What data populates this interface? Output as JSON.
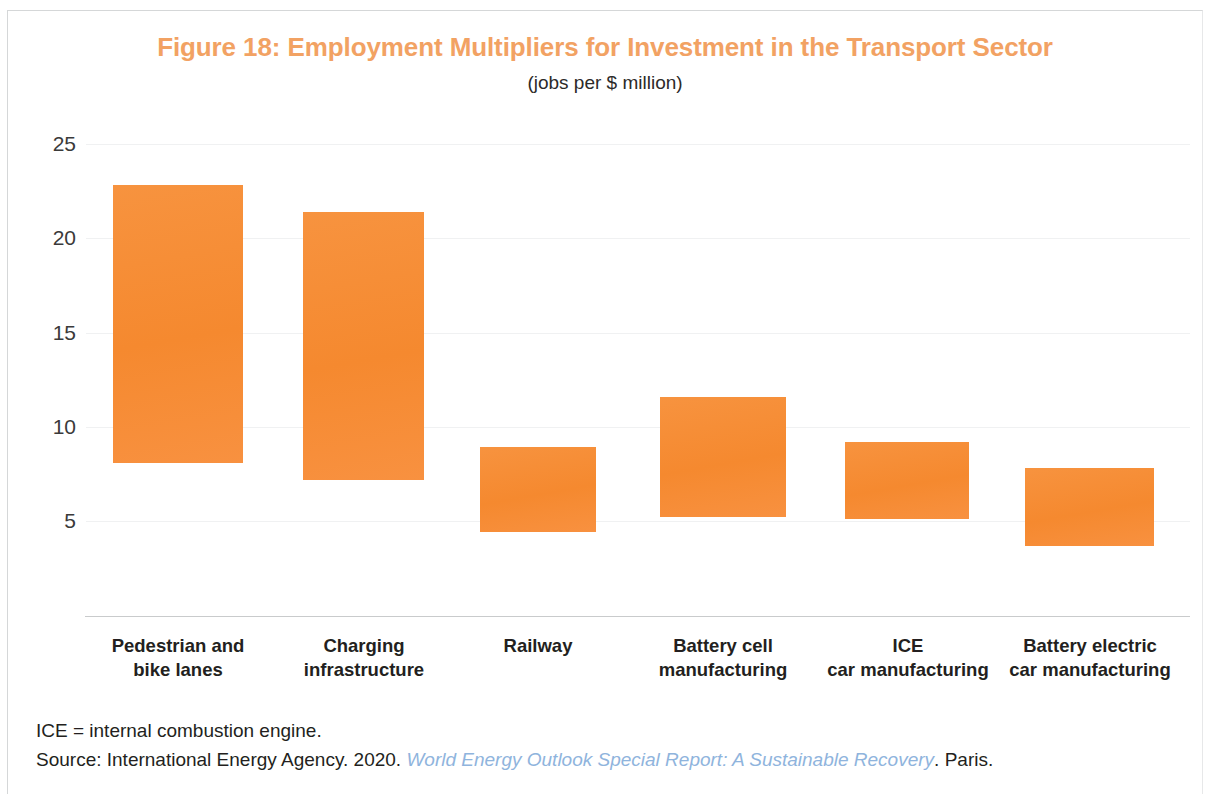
{
  "figure": {
    "title": "Figure 18: Employment Multipliers for Investment in the Transport Sector",
    "subtitle": "(jobs per $ million)",
    "title_color": "#f2a263",
    "bar_color": "#f68b34",
    "axis_color": "#c9cbcc",
    "grid_color": "#f0f1f2"
  },
  "notes": {
    "abbreviation": "ICE = internal combustion engine.",
    "source_prefix": "Source: International Energy Agency. 2020. ",
    "source_title": "World Energy Outlook Special Report: A Sustainable Recovery",
    "source_suffix": ". Paris.",
    "source_link_color": "#8fb4dd"
  },
  "chart_data": {
    "type": "bar",
    "subtype": "floating-range-bar",
    "title": "Figure 18: Employment Multipliers for Investment in the Transport Sector",
    "subtitle": "(jobs per $ million)",
    "xlabel": "",
    "ylabel": "",
    "ylim": [
      0,
      26
    ],
    "yticks": [
      25,
      20,
      15,
      10,
      5
    ],
    "ytick_labels": [
      "25",
      "20",
      "15",
      "10",
      "5"
    ],
    "grid": true,
    "grid_axis": "y",
    "legend": null,
    "categories": [
      "Pedestrian and bike lanes",
      "Charging infrastructure",
      "Railway",
      "Battery cell manufacturing",
      "ICE car manufacturing",
      "Battery electric car manufacturing"
    ],
    "category_lines": [
      [
        "Pedestrian and",
        "bike lanes"
      ],
      [
        "Charging",
        "infrastructure"
      ],
      [
        "Railway"
      ],
      [
        "Battery cell",
        "manufacturing"
      ],
      [
        "ICE",
        "car manufacturing"
      ],
      [
        "Battery electric",
        "car manufacturing"
      ]
    ],
    "series": [
      {
        "name": "low",
        "values": [
          8.1,
          7.2,
          4.4,
          5.2,
          5.1,
          3.7
        ]
      },
      {
        "name": "high",
        "values": [
          22.8,
          21.4,
          8.9,
          11.6,
          9.2,
          7.8
        ]
      }
    ],
    "bars": [
      {
        "category": "Pedestrian and bike lanes",
        "low": 8.1,
        "high": 22.8
      },
      {
        "category": "Charging infrastructure",
        "low": 7.2,
        "high": 21.4
      },
      {
        "category": "Railway",
        "low": 4.4,
        "high": 8.9
      },
      {
        "category": "Battery cell manufacturing",
        "low": 5.2,
        "high": 11.6
      },
      {
        "category": "ICE car manufacturing",
        "low": 5.1,
        "high": 9.2
      },
      {
        "category": "Battery electric car manufacturing",
        "low": 3.7,
        "high": 7.8
      }
    ]
  }
}
